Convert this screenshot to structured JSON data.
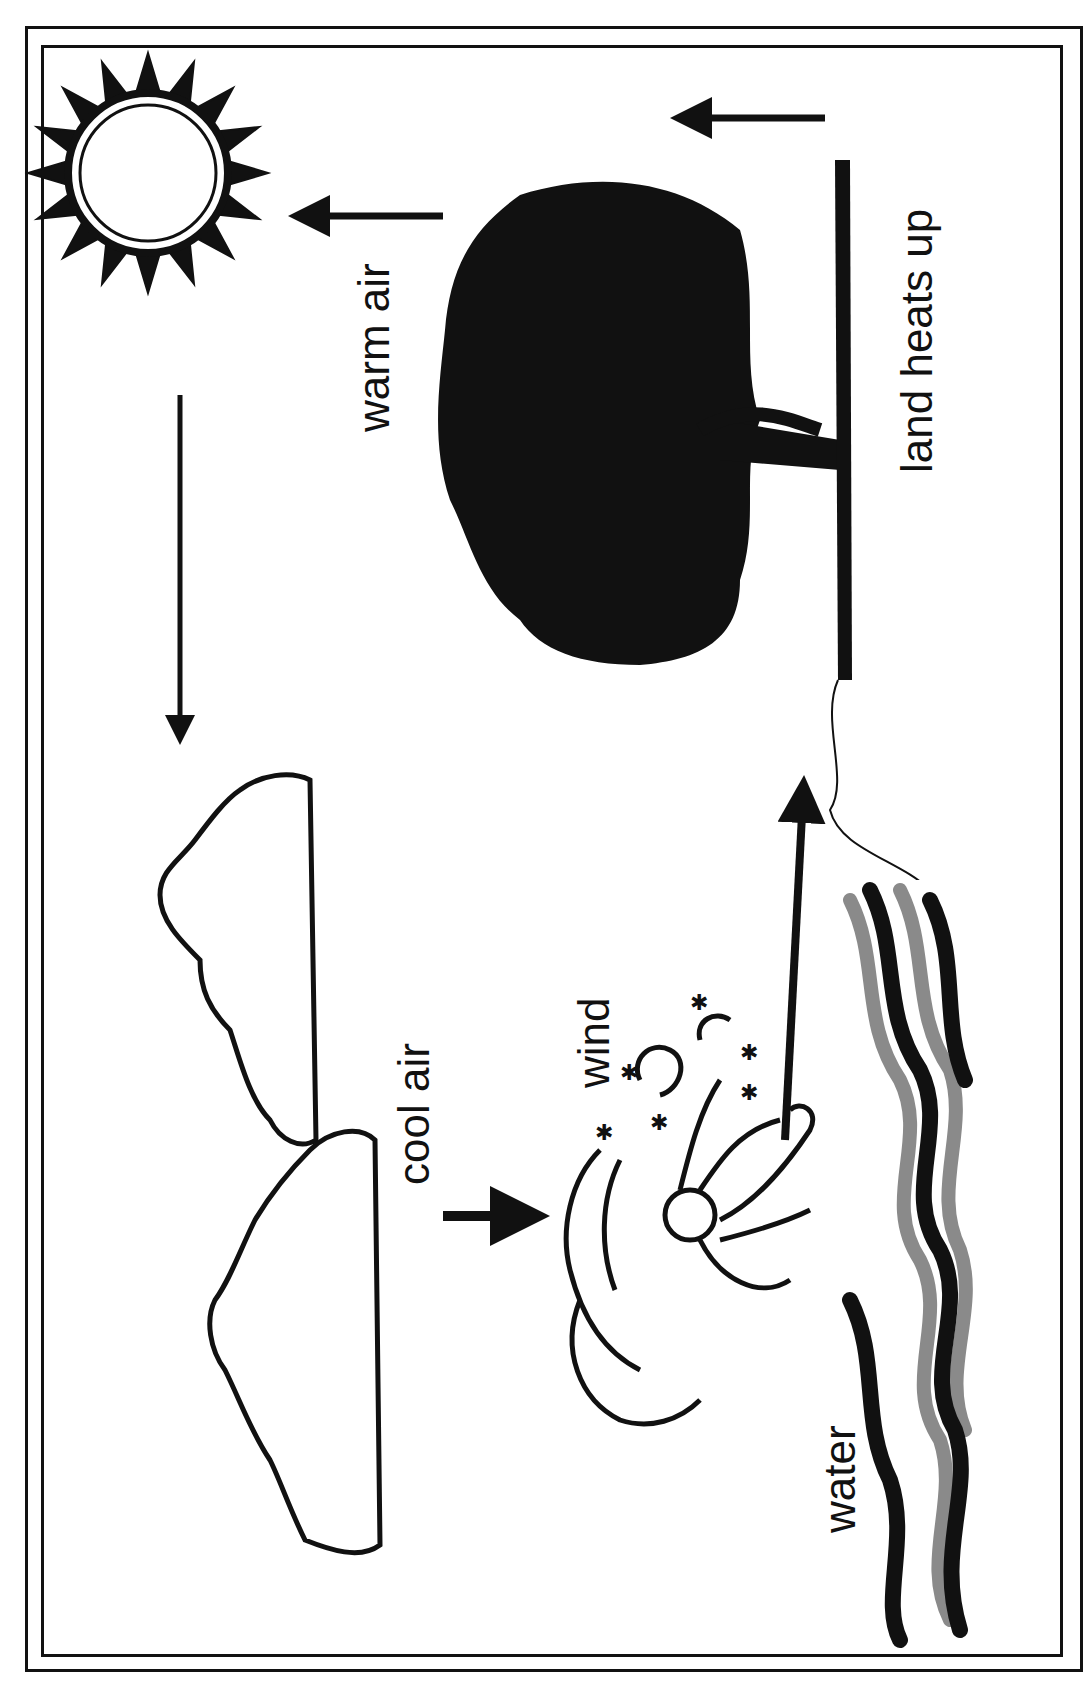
{
  "diagram": {
    "orientation": "rotated 90 degrees counter-clockwise",
    "labels": {
      "warm_air": "warm air",
      "land_heats_up": "land heats up",
      "cool_air": "cool air",
      "wind": "wind",
      "water": "water"
    },
    "elements": [
      {
        "name": "sun",
        "icon": "sun-icon"
      },
      {
        "name": "tree",
        "icon": "tree-icon"
      },
      {
        "name": "land",
        "icon": "ground-line"
      },
      {
        "name": "cloud-1",
        "icon": "cloud-icon"
      },
      {
        "name": "cloud-2",
        "icon": "cloud-icon"
      },
      {
        "name": "wind-figure",
        "icon": "wind-blowing-icon"
      },
      {
        "name": "water",
        "icon": "waves-icon"
      }
    ],
    "arrows": [
      {
        "from": "land",
        "to": "up",
        "meaning": "warm air rises"
      },
      {
        "from": "tree",
        "to": "sun-side",
        "meaning": "warm air rises"
      },
      {
        "from": "sun-side",
        "to": "clouds",
        "meaning": "air moves toward sea"
      },
      {
        "from": "clouds",
        "to": "wind",
        "meaning": "cool air sinks"
      },
      {
        "from": "wind",
        "to": "land",
        "meaning": "wind blows to land"
      }
    ],
    "colors": {
      "ink": "#111111",
      "paper": "#ffffff",
      "water_gray": "#8a8a8a"
    }
  }
}
